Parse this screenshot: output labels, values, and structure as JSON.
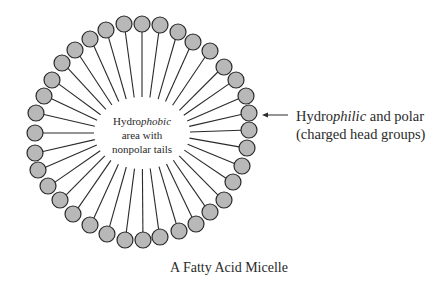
{
  "figure": {
    "caption": "A Fatty Acid Micelle",
    "center_label": {
      "line1_prefix": "Hydro",
      "line1_italic": "phobic",
      "line2": "area with",
      "line3": "nonpolar tails"
    },
    "side_label": {
      "line1_prefix": "Hydro",
      "line1_italic": "philic",
      "line1_suffix": " and polar",
      "line2": "(charged head groups)"
    },
    "colors": {
      "head_fill": "#b8b8b8",
      "stroke": "#2a2a2a",
      "background": "#ffffff"
    },
    "micelle": {
      "center": [
        142,
        133
      ],
      "head_radius": 8,
      "inner_radius_x": 48,
      "inner_radius_y": 36,
      "head_count": 36,
      "heads": [
        [
          124,
          24
        ],
        [
          142,
          24
        ],
        [
          160,
          25
        ],
        [
          178,
          32
        ],
        [
          193,
          42
        ],
        [
          210,
          51
        ],
        [
          224,
          67
        ],
        [
          236,
          80
        ],
        [
          246,
          96
        ],
        [
          249,
          113
        ],
        [
          249,
          130
        ],
        [
          247,
          148
        ],
        [
          242,
          166
        ],
        [
          233,
          182
        ],
        [
          224,
          200
        ],
        [
          210,
          212
        ],
        [
          196,
          224
        ],
        [
          179,
          231
        ],
        [
          160,
          237
        ],
        [
          143,
          240
        ],
        [
          125,
          240
        ],
        [
          107,
          234
        ],
        [
          90,
          225
        ],
        [
          73,
          214
        ],
        [
          60,
          200
        ],
        [
          48,
          186
        ],
        [
          38,
          170
        ],
        [
          35,
          153
        ],
        [
          35,
          133
        ],
        [
          36,
          113
        ],
        [
          44,
          96
        ],
        [
          52,
          80
        ],
        [
          62,
          63
        ],
        [
          75,
          50
        ],
        [
          90,
          39
        ],
        [
          106,
          30
        ]
      ]
    },
    "arrow": {
      "from": [
        288,
        115
      ],
      "to": [
        262,
        115
      ]
    }
  }
}
